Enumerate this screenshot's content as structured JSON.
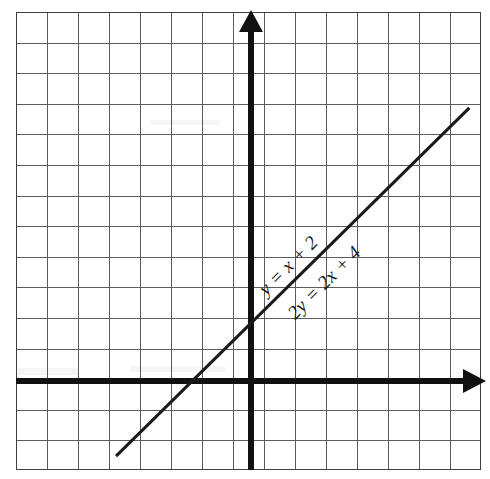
{
  "figure": {
    "width": 490,
    "height": 479,
    "background_color": "#ffffff",
    "grid_line_color": "#5b5b5b",
    "frame_color": "#3f3f3f",
    "axis_color": "#111111",
    "line_color": "#1a1a1a"
  },
  "labels": {
    "upper_equation": "y = x + 2",
    "lower_equation": "2y = 2x + 4",
    "upper_equation_rotation_deg": -45,
    "lower_equation_rotation_deg": -45
  },
  "axes": {
    "x_axis_name": "x-axis",
    "y_axis_name": "y-axis",
    "x_arrow_direction": "right",
    "y_arrow_direction": "up",
    "tick_labels_shown": false
  },
  "chart_data": {
    "type": "line",
    "title": "",
    "xlabel": "",
    "ylabel": "",
    "grid": true,
    "grid_columns": 15,
    "grid_rows": 15,
    "legend": "none",
    "xlim": [
      -7.5,
      7.5
    ],
    "ylim": [
      -3.5,
      11.5
    ],
    "annotations": [
      {
        "text": "y = x + 2",
        "position": "above-line",
        "rotation_deg": -45
      },
      {
        "text": "2y = 2x + 4",
        "position": "below-line",
        "rotation_deg": -45
      }
    ],
    "series": [
      {
        "name": "y = x + 2",
        "equivalent_name": "2y = 2x + 4",
        "slope": 1,
        "y_intercept": 2,
        "x_intercept": -2,
        "x": [
          -4.4,
          7.0
        ],
        "values": [
          -2.4,
          9.0
        ],
        "points": [
          {
            "x": -4.4,
            "y": -2.4
          },
          {
            "x": -2.0,
            "y": 0.0
          },
          {
            "x": 0.0,
            "y": 2.0
          },
          {
            "x": 7.0,
            "y": 9.0
          }
        ]
      }
    ]
  }
}
